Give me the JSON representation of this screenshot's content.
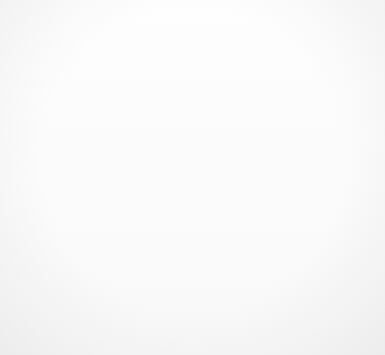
{
  "scene": {
    "title": "Scanned page with rotated letter F, black sticks, lace texture and poem text",
    "background_color": "#fdfdfd",
    "ink_color": "#141414",
    "letter_block_color": "#4a4847"
  },
  "poem": {
    "lines": [
      "So  the top hat",
      "got scared",
      "and  the   tux   as   well",
      "then   the",
      "OH such a",
      "lovely lace",
      "scarf as well"
    ],
    "line1": "So  the top hat",
    "line2": "got scared",
    "line3": "and  the   tux   as   well",
    "line4": "then   the",
    "line5": "OH such a",
    "line6": "lovely lace",
    "line7": "scarf as well"
  },
  "objects": {
    "letter_block": "F",
    "shapes": [
      "letter-f-block",
      "chevron-bar-upper",
      "chevron-bar-lower",
      "arrowhead-blob",
      "long-bar-above-lovely-lace",
      "short-tick-bar",
      "cross-bar-horizontal",
      "cross-bar-vertical",
      "diagonal-bar-upper-right",
      "thin-line-left",
      "thin-line-right",
      "vertical-bar-right",
      "hook-tick-right",
      "diamond-slash-glyph",
      "lace-net-blob"
    ]
  }
}
